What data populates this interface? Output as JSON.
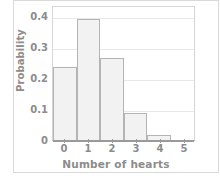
{
  "chart_data": {
    "type": "bar",
    "title": "",
    "subtitle": "",
    "xlabel": "Number of hearts",
    "ylabel": "Probability",
    "categories": [
      "0",
      "1",
      "2",
      "3",
      "4",
      "5"
    ],
    "values": [
      0.24,
      0.4,
      0.27,
      0.088,
      0.015,
      0
    ],
    "xlim": [
      0,
      6
    ],
    "ylim": [
      0,
      0.44
    ],
    "x_tick_labels": [
      "0",
      "1",
      "2",
      "3",
      "4",
      "5"
    ],
    "y_tick_labels": [
      "0",
      "0.1",
      "0.2",
      "0.3",
      "0.4"
    ],
    "y_tick_values": [
      0,
      0.1,
      0.2,
      0.3,
      0.4
    ],
    "grid": "horizontal",
    "legend": "none",
    "annotations": [],
    "colors": {
      "bar_fill": "#f2f2f2",
      "bar_border": "#b4b4b4",
      "gridline": "#e8e8e8",
      "axis": "#9a9a9a",
      "text": "#8c8c8c",
      "plot_background": "#ffffff",
      "figure_border": "#d9d9d9"
    }
  }
}
